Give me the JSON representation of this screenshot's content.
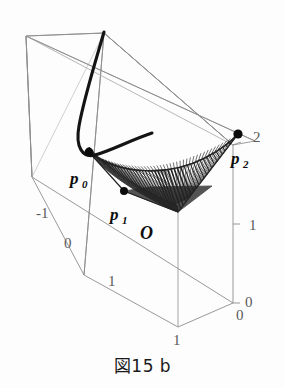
{
  "figure": {
    "caption": "図15 b",
    "background_color": "#fdfdfd",
    "box_line_color": "#8d8d8d",
    "curve_color": "#141414",
    "surface_color": "#111111",
    "tick_label_color": "#5a5a5a"
  },
  "labels": {
    "p0": "p",
    "p0_sub": "0",
    "p1": "p",
    "p1_sub": "1",
    "p2": "p",
    "p2_sub": "2",
    "origin": "O"
  },
  "ticks": {
    "depth_axis": [
      "-1",
      "0",
      "1"
    ],
    "vertical_axis": [
      "2",
      "1",
      "0"
    ],
    "base_front": "1",
    "base_right": "0"
  },
  "chart_data": {
    "type": "line",
    "title": "図15 b",
    "xlabel": "",
    "ylabel": "",
    "grid": false,
    "legend": "none",
    "projection": "3d-parallel",
    "xlim": [
      -1,
      1
    ],
    "ylim": [
      0,
      1
    ],
    "zlim": [
      0,
      2
    ],
    "axis_ticks": {
      "depth": [
        -1,
        0,
        1
      ],
      "vertical": [
        0,
        1,
        2
      ],
      "base": [
        0,
        1
      ]
    },
    "annotations": [
      {
        "text": "p0",
        "x": -0.6,
        "y": 0.25,
        "z": 0.62
      },
      {
        "text": "p1",
        "x": -0.1,
        "y": 0.55,
        "z": 0.3
      },
      {
        "text": "p2",
        "x": 1.0,
        "y": 0.05,
        "z": 2.0
      },
      {
        "text": "O",
        "x": 0.15,
        "y": 0.95,
        "z": 0.0
      }
    ],
    "series": [
      {
        "name": "space-curve",
        "type": "line",
        "style": "thick-solid",
        "color": "#141414",
        "points_2d": [
          [
            104,
            33
          ],
          [
            100,
            44
          ],
          [
            95,
            58
          ],
          [
            90,
            74
          ],
          [
            86,
            90
          ],
          [
            83,
            104
          ],
          [
            81,
            116
          ],
          [
            79,
            128
          ],
          [
            79,
            138
          ],
          [
            80,
            146
          ],
          [
            83,
            152
          ],
          [
            87,
            155
          ],
          [
            92,
            156
          ],
          [
            99,
            154
          ],
          [
            107,
            150
          ],
          [
            117,
            145
          ],
          [
            128,
            140
          ],
          [
            138,
            136
          ],
          [
            146,
            134
          ],
          [
            152,
            133
          ]
        ]
      },
      {
        "name": "ruled-surface",
        "type": "ruled-patch",
        "color": "#111111",
        "n_rulings": 46,
        "edge_a": [
          [
            89,
            152
          ],
          [
            238,
            134
          ]
        ],
        "edge_b": [
          [
            124,
            191
          ],
          [
            178,
            212
          ]
        ],
        "control_points": [
          {
            "name": "p0",
            "px": [
              89,
              152
            ]
          },
          {
            "name": "p1",
            "px": [
              124,
              191
            ]
          },
          {
            "name": "p2",
            "px": [
              238,
              134
            ]
          },
          {
            "name": "apex",
            "px": [
              178,
              212
            ]
          }
        ]
      }
    ],
    "markers": [
      {
        "name": "p0",
        "px": [
          89,
          152
        ],
        "r": 4.4
      },
      {
        "name": "p1",
        "px": [
          124,
          191
        ],
        "r": 4.0
      },
      {
        "name": "p2",
        "px": [
          238,
          134
        ],
        "r": 4.6
      }
    ],
    "bounding_box_px": {
      "back_top_left": [
        26,
        36
      ],
      "back_top_right": [
        223,
        64
      ],
      "front_top_left": [
        104,
        33
      ],
      "front_top_right": [
        233,
        145
      ],
      "back_bottom_left": [
        32,
        177
      ],
      "front_bottom_left": [
        84,
        275
      ],
      "front_bottom_mid": [
        178,
        327
      ],
      "front_bottom_right": [
        233,
        303
      ],
      "back_bottom_right": [
        255,
        141
      ]
    }
  }
}
